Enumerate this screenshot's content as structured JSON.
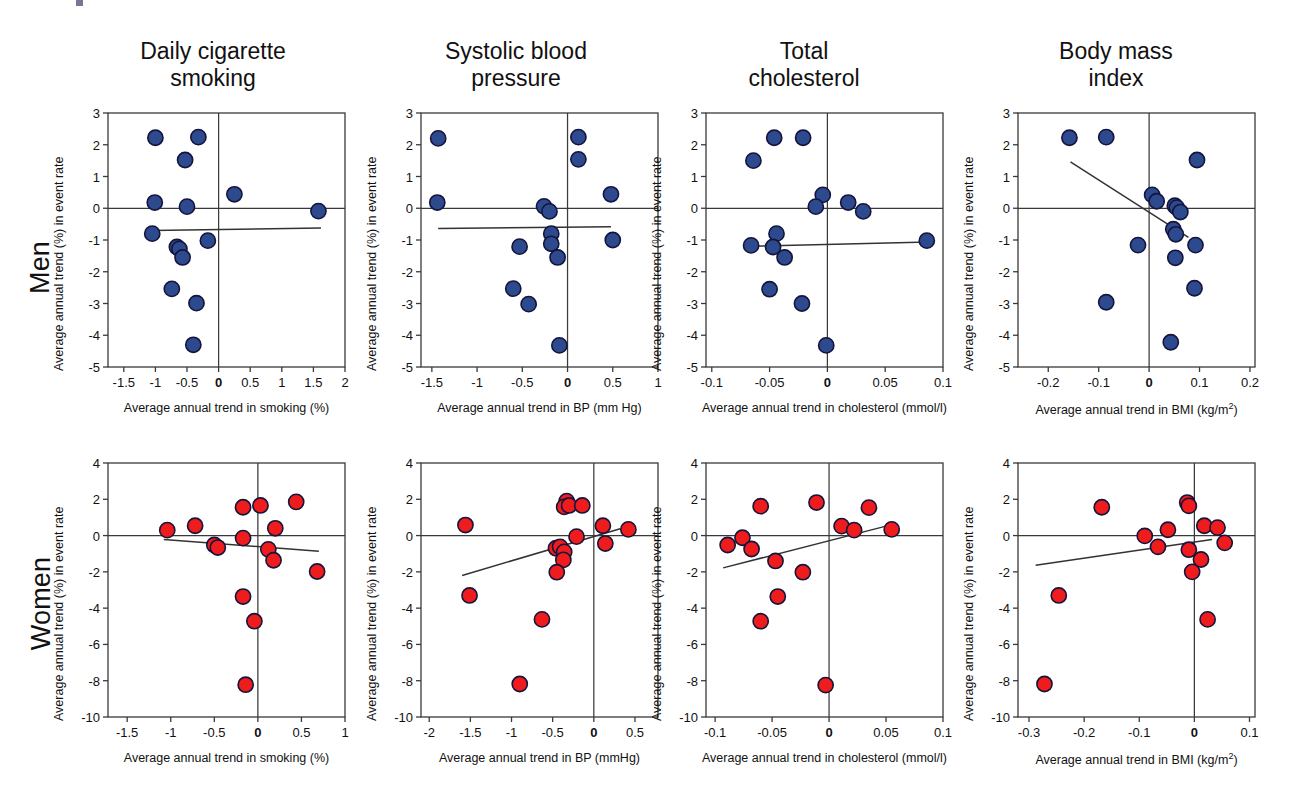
{
  "figure": {
    "row_labels": [
      "Men",
      "Women"
    ],
    "column_titles": [
      "Daily cigarette\nsmoking",
      "Systolic blood\npressure",
      "Total\ncholesterol",
      "Body mass\nindex"
    ],
    "shared_ylabel": "Average annual trend (%) in event rate",
    "colors": {
      "men_marker": "#2e4a8f",
      "women_marker": "#ee1c1c",
      "marker_edge": "#14143c",
      "axis": "#3a3a3a",
      "trend_line": "#333333"
    }
  },
  "chart_data": [
    {
      "type": "scatter",
      "panel": "men-smoking",
      "row": "Men",
      "title": "Daily cigarette smoking",
      "xlabel": "Average annual trend in smoking (%)",
      "ylabel": "Average annual trend (%) in event rate",
      "xlim": [
        -1.75,
        2.0
      ],
      "ylim": [
        -5,
        3
      ],
      "xticks": [
        -1.5,
        -1,
        -0.5,
        0,
        0.5,
        1,
        1.5,
        2
      ],
      "xticklabels": [
        "-1.5",
        "-1",
        "-0.5",
        "0",
        "0.5",
        "1",
        "1.5",
        "2"
      ],
      "yticks": [
        -5,
        -4,
        -3,
        -2,
        -1,
        0,
        1,
        2,
        3
      ],
      "yticklabels": [
        "-5",
        "-4",
        "-3",
        "-2",
        "-1",
        "0",
        "1",
        "2",
        "3"
      ],
      "zero_lines": {
        "x": 0,
        "y": 0
      },
      "points": [
        {
          "x": -1.0,
          "y": 2.22
        },
        {
          "x": -0.32,
          "y": 2.24
        },
        {
          "x": -0.53,
          "y": 1.52
        },
        {
          "x": -1.01,
          "y": 0.18
        },
        {
          "x": -0.5,
          "y": 0.05
        },
        {
          "x": 0.25,
          "y": 0.44
        },
        {
          "x": 1.58,
          "y": -0.09
        },
        {
          "x": -1.05,
          "y": -0.8
        },
        {
          "x": -0.17,
          "y": -1.02
        },
        {
          "x": -0.66,
          "y": -1.22
        },
        {
          "x": -0.62,
          "y": -1.28
        },
        {
          "x": -0.57,
          "y": -1.55
        },
        {
          "x": -0.74,
          "y": -2.54
        },
        {
          "x": -0.35,
          "y": -2.99
        },
        {
          "x": -0.4,
          "y": -4.3
        }
      ],
      "trend_line": {
        "x1": -1.06,
        "y1": -0.7,
        "x2": 1.62,
        "y2": -0.62
      }
    },
    {
      "type": "scatter",
      "panel": "men-bp",
      "row": "Men",
      "title": "Systolic blood pressure",
      "xlabel": "Average annual trend in BP (mm Hg)",
      "ylabel": "Average annual trend (%) in event rate",
      "xlim": [
        -1.62,
        1.0
      ],
      "ylim": [
        -5,
        3
      ],
      "xticks": [
        -1.5,
        -1,
        -0.5,
        0,
        0.5,
        1
      ],
      "xticklabels": [
        "-1.5",
        "-1",
        "-0.5",
        "0",
        "0.5",
        "1"
      ],
      "yticks": [
        -5,
        -4,
        -3,
        -2,
        -1,
        0,
        1,
        2,
        3
      ],
      "yticklabels": [
        "-5",
        "-4",
        "-3",
        "-2",
        "-1",
        "0",
        "1",
        "2",
        "3"
      ],
      "zero_lines": {
        "x": 0,
        "y": 0
      },
      "points": [
        {
          "x": -1.43,
          "y": 2.2
        },
        {
          "x": 0.12,
          "y": 2.24
        },
        {
          "x": 0.12,
          "y": 1.54
        },
        {
          "x": -1.44,
          "y": 0.18
        },
        {
          "x": 0.48,
          "y": 0.44
        },
        {
          "x": -0.26,
          "y": 0.06
        },
        {
          "x": -0.2,
          "y": -0.1
        },
        {
          "x": -0.18,
          "y": -0.8
        },
        {
          "x": -0.18,
          "y": -1.12
        },
        {
          "x": -0.53,
          "y": -1.21
        },
        {
          "x": 0.5,
          "y": -1.0
        },
        {
          "x": -0.11,
          "y": -1.55
        },
        {
          "x": -0.6,
          "y": -2.53
        },
        {
          "x": -0.43,
          "y": -3.02
        },
        {
          "x": -0.09,
          "y": -4.32
        }
      ],
      "trend_line": {
        "x1": -1.43,
        "y1": -0.64,
        "x2": 0.48,
        "y2": -0.58
      }
    },
    {
      "type": "scatter",
      "panel": "men-cholesterol",
      "row": "Men",
      "title": "Total cholesterol",
      "xlabel": "Average annual trend in cholesterol (mmol/l)",
      "ylabel": "Average annual trend (%) in event rate",
      "xlim": [
        -0.105,
        0.1
      ],
      "ylim": [
        -5,
        3
      ],
      "xticks": [
        -0.1,
        -0.05,
        0,
        0.05,
        0.1
      ],
      "xticklabels": [
        "-0.1",
        "-0.05",
        "0",
        "0.05",
        "0.1"
      ],
      "yticks": [
        -5,
        -4,
        -3,
        -2,
        -1,
        0,
        1,
        2,
        3
      ],
      "yticklabels": [
        "-5",
        "-4",
        "-3",
        "-2",
        "-1",
        "0",
        "1",
        "2",
        "3"
      ],
      "zero_lines": {
        "x": 0,
        "y": 0
      },
      "points": [
        {
          "x": -0.046,
          "y": 2.22
        },
        {
          "x": -0.021,
          "y": 2.22
        },
        {
          "x": -0.064,
          "y": 1.5
        },
        {
          "x": -0.004,
          "y": 0.42
        },
        {
          "x": -0.01,
          "y": 0.05
        },
        {
          "x": 0.018,
          "y": 0.18
        },
        {
          "x": 0.031,
          "y": -0.1
        },
        {
          "x": -0.044,
          "y": -0.8
        },
        {
          "x": -0.066,
          "y": -1.17
        },
        {
          "x": -0.047,
          "y": -1.22
        },
        {
          "x": -0.037,
          "y": -1.55
        },
        {
          "x": 0.086,
          "y": -1.02
        },
        {
          "x": -0.05,
          "y": -2.55
        },
        {
          "x": -0.022,
          "y": -3.0
        },
        {
          "x": -0.001,
          "y": -4.32
        }
      ],
      "trend_line": {
        "x1": -0.067,
        "y1": -1.2,
        "x2": 0.088,
        "y2": -1.06
      }
    },
    {
      "type": "scatter",
      "panel": "men-bmi",
      "row": "Men",
      "title": "Body mass index",
      "xlabel": "Average annual trend in BMI (kg/m2)",
      "ylabel": "Average annual trend (%) in event rate",
      "xlim": [
        -0.26,
        0.21
      ],
      "ylim": [
        -5,
        3
      ],
      "xticks": [
        -0.2,
        -0.1,
        0,
        0.1,
        0.2
      ],
      "xticklabels": [
        "-0.2",
        "-0.1",
        "0",
        "0.1",
        "0.2"
      ],
      "yticks": [
        -5,
        -4,
        -3,
        -2,
        -1,
        0,
        1,
        2,
        3
      ],
      "yticklabels": [
        "-5",
        "-4",
        "-3",
        "-2",
        "-1",
        "0",
        "1",
        "2",
        "3"
      ],
      "zero_lines": {
        "x": 0,
        "y": 0
      },
      "points": [
        {
          "x": -0.158,
          "y": 2.22
        },
        {
          "x": -0.085,
          "y": 2.24
        },
        {
          "x": 0.095,
          "y": 1.52
        },
        {
          "x": 0.006,
          "y": 0.42
        },
        {
          "x": 0.015,
          "y": 0.22
        },
        {
          "x": 0.051,
          "y": 0.08
        },
        {
          "x": 0.055,
          "y": 0.02
        },
        {
          "x": 0.062,
          "y": -0.12
        },
        {
          "x": 0.048,
          "y": -0.66
        },
        {
          "x": 0.053,
          "y": -0.82
        },
        {
          "x": -0.022,
          "y": -1.16
        },
        {
          "x": 0.092,
          "y": -1.16
        },
        {
          "x": 0.052,
          "y": -1.56
        },
        {
          "x": 0.09,
          "y": -2.52
        },
        {
          "x": -0.085,
          "y": -2.96
        },
        {
          "x": 0.043,
          "y": -4.22
        }
      ],
      "trend_line": {
        "x1": -0.156,
        "y1": 1.46,
        "x2": 0.078,
        "y2": -0.92
      }
    },
    {
      "type": "scatter",
      "panel": "women-smoking",
      "row": "Women",
      "title": "Daily cigarette smoking",
      "xlabel": "Average annual trend in smoking (%)",
      "ylabel": "Average annual trend (%) in event rate",
      "xlim": [
        -1.72,
        1.0
      ],
      "ylim": [
        -10,
        4
      ],
      "xticks": [
        -1.5,
        -1,
        -0.5,
        0,
        0.5,
        1
      ],
      "xticklabels": [
        "-1.5",
        "-1",
        "-0.5",
        "0",
        "0.5",
        "1"
      ],
      "yticks": [
        -10,
        -8,
        -6,
        -4,
        -2,
        0,
        2,
        4
      ],
      "yticklabels": [
        "-10",
        "-8",
        "-6",
        "-4",
        "-2",
        "0",
        "2",
        "4"
      ],
      "zero_lines": {
        "x": 0,
        "y": 0
      },
      "points": [
        {
          "x": -0.17,
          "y": 1.56
        },
        {
          "x": 0.03,
          "y": 1.66
        },
        {
          "x": 0.44,
          "y": 1.86
        },
        {
          "x": -1.04,
          "y": 0.3
        },
        {
          "x": -0.72,
          "y": 0.54
        },
        {
          "x": 0.2,
          "y": 0.4
        },
        {
          "x": -0.17,
          "y": -0.14
        },
        {
          "x": -0.5,
          "y": -0.52
        },
        {
          "x": -0.46,
          "y": -0.66
        },
        {
          "x": 0.12,
          "y": -0.76
        },
        {
          "x": 0.18,
          "y": -1.36
        },
        {
          "x": 0.68,
          "y": -1.98
        },
        {
          "x": -0.17,
          "y": -3.36
        },
        {
          "x": -0.04,
          "y": -4.72
        },
        {
          "x": -0.14,
          "y": -8.22
        }
      ],
      "trend_line": {
        "x1": -1.08,
        "y1": -0.22,
        "x2": 0.7,
        "y2": -0.86
      }
    },
    {
      "type": "scatter",
      "panel": "women-bp",
      "row": "Women",
      "title": "Systolic blood pressure",
      "xlabel": "Average annual trend in BP (mmHg)",
      "ylabel": "Average annual trend (%) in event rate",
      "xlim": [
        -2.1,
        0.78
      ],
      "ylim": [
        -10,
        4
      ],
      "xticks": [
        -2,
        -1.5,
        -1,
        -0.5,
        0,
        0.5
      ],
      "xticklabels": [
        "-2",
        "-1.5",
        "-1",
        "-0.5",
        "0",
        "0.5"
      ],
      "yticks": [
        -10,
        -8,
        -6,
        -4,
        -2,
        0,
        2,
        4
      ],
      "yticklabels": [
        "-10",
        "-8",
        "-6",
        "-4",
        "-2",
        "0",
        "2",
        "4"
      ],
      "zero_lines": {
        "x": 0,
        "y": 0
      },
      "points": [
        {
          "x": -0.33,
          "y": 1.9
        },
        {
          "x": -0.36,
          "y": 1.58
        },
        {
          "x": -0.3,
          "y": 1.66
        },
        {
          "x": -0.14,
          "y": 1.66
        },
        {
          "x": -1.56,
          "y": 0.58
        },
        {
          "x": 0.11,
          "y": 0.54
        },
        {
          "x": 0.42,
          "y": 0.34
        },
        {
          "x": -0.21,
          "y": -0.06
        },
        {
          "x": 0.14,
          "y": -0.44
        },
        {
          "x": -0.46,
          "y": -0.7
        },
        {
          "x": -0.41,
          "y": -0.62
        },
        {
          "x": -0.36,
          "y": -0.9
        },
        {
          "x": -0.37,
          "y": -1.34
        },
        {
          "x": -0.45,
          "y": -2.02
        },
        {
          "x": -1.51,
          "y": -3.3
        },
        {
          "x": -0.63,
          "y": -4.62
        },
        {
          "x": -0.9,
          "y": -8.18
        }
      ],
      "trend_line": {
        "x1": -1.6,
        "y1": -2.2,
        "x2": 0.32,
        "y2": 0.38
      }
    },
    {
      "type": "scatter",
      "panel": "women-cholesterol",
      "row": "Women",
      "title": "Total cholesterol",
      "xlabel": "Average annual trend in cholesterol (mmol/l)",
      "ylabel": "Average annual trend (%) in event rate",
      "xlim": [
        -0.108,
        0.1
      ],
      "ylim": [
        -10,
        4
      ],
      "xticks": [
        -0.1,
        -0.05,
        0,
        0.05,
        0.1
      ],
      "xticklabels": [
        "-0.1",
        "-0.05",
        "0",
        "0.05",
        "0.1"
      ],
      "yticks": [
        -10,
        -8,
        -6,
        -4,
        -2,
        0,
        2,
        4
      ],
      "yticklabels": [
        "-10",
        "-8",
        "-6",
        "-4",
        "-2",
        "0",
        "2",
        "4"
      ],
      "zero_lines": {
        "x": 0,
        "y": 0
      },
      "points": [
        {
          "x": -0.06,
          "y": 1.62
        },
        {
          "x": -0.011,
          "y": 1.82
        },
        {
          "x": 0.035,
          "y": 1.54
        },
        {
          "x": 0.011,
          "y": 0.52
        },
        {
          "x": 0.022,
          "y": 0.3
        },
        {
          "x": 0.055,
          "y": 0.34
        },
        {
          "x": -0.089,
          "y": -0.52
        },
        {
          "x": -0.076,
          "y": -0.12
        },
        {
          "x": -0.068,
          "y": -0.74
        },
        {
          "x": -0.047,
          "y": -1.4
        },
        {
          "x": -0.023,
          "y": -2.02
        },
        {
          "x": -0.045,
          "y": -3.36
        },
        {
          "x": -0.06,
          "y": -4.72
        },
        {
          "x": -0.003,
          "y": -8.24
        }
      ],
      "trend_line": {
        "x1": -0.093,
        "y1": -1.78,
        "x2": 0.05,
        "y2": 0.52
      }
    },
    {
      "type": "scatter",
      "panel": "women-bmi",
      "row": "Women",
      "title": "Body mass index",
      "xlabel": "Average annual trend in BMI (kg/m2)",
      "ylabel": "Average annual trend (%) in event rate",
      "xlim": [
        -0.32,
        0.11
      ],
      "ylim": [
        -10,
        4
      ],
      "xticks": [
        -0.3,
        -0.2,
        -0.1,
        0,
        0.1
      ],
      "xticklabels": [
        "-0.3",
        "-0.2",
        "-0.1",
        "0",
        "0.1"
      ],
      "yticks": [
        -10,
        -8,
        -6,
        -4,
        -2,
        0,
        2,
        4
      ],
      "yticklabels": [
        "-10",
        "-8",
        "-6",
        "-4",
        "-2",
        "0",
        "2",
        "4"
      ],
      "zero_lines": {
        "x": 0,
        "y": 0
      },
      "points": [
        {
          "x": -0.168,
          "y": 1.56
        },
        {
          "x": -0.013,
          "y": 1.82
        },
        {
          "x": -0.01,
          "y": 1.64
        },
        {
          "x": -0.09,
          "y": -0.02
        },
        {
          "x": -0.048,
          "y": 0.32
        },
        {
          "x": 0.018,
          "y": 0.54
        },
        {
          "x": 0.042,
          "y": 0.44
        },
        {
          "x": -0.066,
          "y": -0.62
        },
        {
          "x": -0.01,
          "y": -0.78
        },
        {
          "x": 0.055,
          "y": -0.4
        },
        {
          "x": 0.012,
          "y": -1.32
        },
        {
          "x": -0.004,
          "y": -2.0
        },
        {
          "x": -0.246,
          "y": -3.3
        },
        {
          "x": 0.024,
          "y": -4.62
        },
        {
          "x": -0.272,
          "y": -8.18
        }
      ],
      "trend_line": {
        "x1": -0.288,
        "y1": -1.64,
        "x2": 0.032,
        "y2": -0.22
      }
    }
  ]
}
